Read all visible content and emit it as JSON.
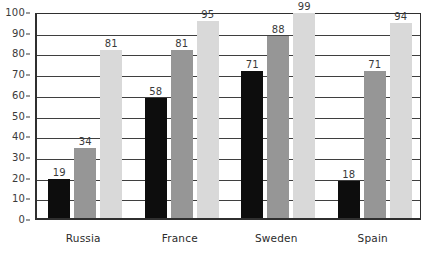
{
  "chart_data": {
    "type": "bar",
    "title": "",
    "xlabel": "",
    "ylabel": "",
    "ylim": [
      0,
      100
    ],
    "yticks": [
      0,
      10,
      20,
      30,
      40,
      50,
      60,
      70,
      80,
      90,
      100
    ],
    "grid": true,
    "legend": "none",
    "categories": [
      "Russia",
      "France",
      "Sweden",
      "Spain"
    ],
    "series": [
      {
        "name": "series-1",
        "color": "#0d0d0d",
        "values": [
          19,
          58,
          71,
          18
        ]
      },
      {
        "name": "series-2",
        "color": "#969696",
        "values": [
          34,
          81,
          88,
          71
        ]
      },
      {
        "name": "series-3",
        "color": "#d9d9d9",
        "values": [
          81,
          95,
          99,
          94
        ]
      }
    ],
    "data_labels": [
      [
        "19",
        "34",
        "81"
      ],
      [
        "58",
        "81",
        "95"
      ],
      [
        "71",
        "88",
        "99"
      ],
      [
        "18",
        "71",
        "94"
      ]
    ]
  },
  "axis": {
    "y_tick_labels": [
      "100",
      "90",
      "80",
      "70",
      "60",
      "50",
      "40",
      "30",
      "20",
      "10",
      "0"
    ],
    "x_tick_labels": [
      "Russia",
      "France",
      "Sweden",
      "Spain"
    ]
  },
  "colors": {
    "series_1": "#0d0d0d",
    "series_2": "#969696",
    "series_3": "#d9d9d9",
    "axis": "#2f2f2f",
    "gridline": "#3f3f3f",
    "text": "#2b2b2b",
    "background": "#ffffff"
  }
}
